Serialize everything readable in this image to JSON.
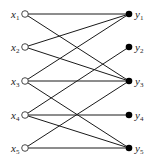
{
  "diagram": {
    "type": "bipartite-graph",
    "left_nodes": [
      {
        "id": "x1",
        "label": "x",
        "sub": "1",
        "x": 25,
        "y": 14
      },
      {
        "id": "x2",
        "label": "x",
        "sub": "2",
        "x": 25,
        "y": 47
      },
      {
        "id": "x3",
        "label": "x",
        "sub": "3",
        "x": 25,
        "y": 81
      },
      {
        "id": "x4",
        "label": "x",
        "sub": "4",
        "x": 25,
        "y": 115
      },
      {
        "id": "x5",
        "label": "x",
        "sub": "5",
        "x": 25,
        "y": 148
      }
    ],
    "right_nodes": [
      {
        "id": "y1",
        "label": "y",
        "sub": "1",
        "x": 129,
        "y": 14
      },
      {
        "id": "y2",
        "label": "y",
        "sub": "2",
        "x": 129,
        "y": 47
      },
      {
        "id": "y3",
        "label": "y",
        "sub": "3",
        "x": 129,
        "y": 81
      },
      {
        "id": "y4",
        "label": "y",
        "sub": "4",
        "x": 129,
        "y": 115
      },
      {
        "id": "y5",
        "label": "y",
        "sub": "5",
        "x": 129,
        "y": 148
      }
    ],
    "edges": [
      [
        "x1",
        "y1"
      ],
      [
        "x1",
        "y3"
      ],
      [
        "x2",
        "y1"
      ],
      [
        "x2",
        "y3"
      ],
      [
        "x3",
        "y1"
      ],
      [
        "x3",
        "y3"
      ],
      [
        "x3",
        "y5"
      ],
      [
        "x4",
        "y2"
      ],
      [
        "x4",
        "y4"
      ],
      [
        "x4",
        "y5"
      ],
      [
        "x5",
        "y3"
      ],
      [
        "x5",
        "y5"
      ]
    ],
    "colors": {
      "edge": "#1a1a1a",
      "left_fill": "#ffffff",
      "right_fill": "#000000"
    }
  }
}
